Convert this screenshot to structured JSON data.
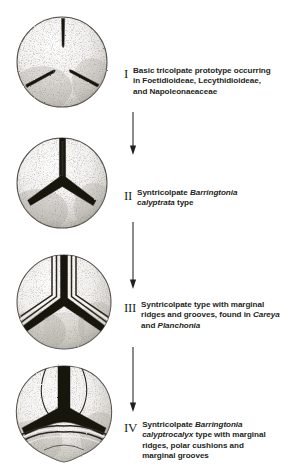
{
  "figure": {
    "background_color": "#ffffff",
    "ink_color": "#231f20",
    "stages": [
      {
        "numeral": "I",
        "grain_name": "pollen-grain-tricolpate",
        "caption_lines": [
          [
            {
              "t": "Basic tricolpate prototype occurring",
              "i": false
            }
          ],
          [
            {
              "t": "in Foetidioideae, Lecythidioideae,",
              "i": false
            }
          ],
          [
            {
              "t": "and Napoleonaeaceae",
              "i": false
            }
          ]
        ]
      },
      {
        "numeral": "II",
        "grain_name": "pollen-grain-syntricolpate-calyptrata",
        "caption_lines": [
          [
            {
              "t": "Syntricolpate ",
              "i": false
            },
            {
              "t": "Barringtonia",
              "i": true
            }
          ],
          [
            {
              "t": "calyptrata",
              "i": true
            },
            {
              "t": " type",
              "i": false
            }
          ]
        ]
      },
      {
        "numeral": "III",
        "grain_name": "pollen-grain-marginal-ridges",
        "caption_lines": [
          [
            {
              "t": "Syntricolpate type with marginal",
              "i": false
            }
          ],
          [
            {
              "t": "ridges and grooves, found in ",
              "i": false
            },
            {
              "t": "Careya",
              "i": true
            }
          ],
          [
            {
              "t": "and ",
              "i": false
            },
            {
              "t": "Planchonia",
              "i": true
            }
          ]
        ]
      },
      {
        "numeral": "IV",
        "grain_name": "pollen-grain-polar-cushions",
        "caption_lines": [
          [
            {
              "t": "Syntricolpate ",
              "i": false
            },
            {
              "t": "Barringtonia",
              "i": true
            }
          ],
          [
            {
              "t": "calyptrocalyx",
              "i": true
            },
            {
              "t": " type with marginal",
              "i": false
            }
          ],
          [
            {
              "t": "ridges, polar cushions and",
              "i": false
            }
          ],
          [
            {
              "t": "marginal grooves",
              "i": false
            }
          ]
        ]
      }
    ],
    "arrows": [
      {
        "name": "arrow-stage-1-to-2"
      },
      {
        "name": "arrow-stage-2-to-3"
      },
      {
        "name": "arrow-stage-3-to-4"
      }
    ]
  }
}
